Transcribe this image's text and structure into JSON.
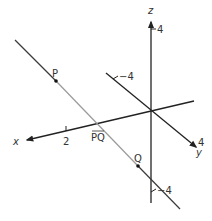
{
  "diagram": {
    "type": "3d-coordinate-axes-with-line",
    "colors": {
      "axis": "#222222",
      "line_outer": "#3a3a3a",
      "segment_pq": "#9a9a9a",
      "point": "#111111",
      "text": "#333333"
    },
    "axes": {
      "x": {
        "label": "x",
        "tick_label": "2"
      },
      "y": {
        "label": "y",
        "positive_tick_label": "4",
        "negative_tick_label": "−4"
      },
      "z": {
        "label": "z",
        "positive_tick_label": "4",
        "negative_tick_label": "−4"
      }
    },
    "points": [
      {
        "name": "P",
        "label": "P"
      },
      {
        "name": "Q",
        "label": "Q"
      }
    ],
    "segment_label": "PQ"
  }
}
